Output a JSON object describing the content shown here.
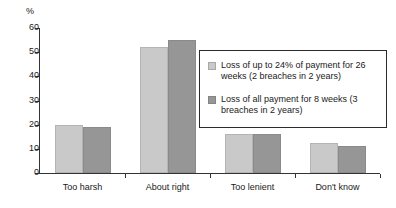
{
  "chart_data": {
    "type": "bar",
    "title": "",
    "xlabel": "",
    "ylabel": "%",
    "ylim": [
      0,
      60
    ],
    "yticks": [
      0,
      10,
      20,
      30,
      40,
      50,
      60
    ],
    "grid": false,
    "legend_position": "right-inside",
    "categories": [
      "Too harsh",
      "About right",
      "Too lenient",
      "Don't know"
    ],
    "series": [
      {
        "name": "Loss of up to 24% of payment for 26 weeks (2 breaches in 2 years)",
        "color": "#c9c9c9",
        "values": [
          20,
          52,
          16,
          12.5
        ]
      },
      {
        "name": "Loss of all payment for 8 weeks (3 breaches in 2 years)",
        "color": "#969696",
        "values": [
          19,
          55,
          16,
          11
        ]
      }
    ]
  },
  "axis": {
    "unit_label": "%",
    "tick_labels": [
      "60",
      "50",
      "40",
      "30",
      "20",
      "10",
      "0"
    ]
  },
  "legend": {
    "entries": [
      {
        "label": "Loss of up to 24% of payment for 26 weeks (2 breaches in 2 years)"
      },
      {
        "label": "Loss of all payment for 8 weeks (3 breaches in 2 years)"
      }
    ]
  }
}
